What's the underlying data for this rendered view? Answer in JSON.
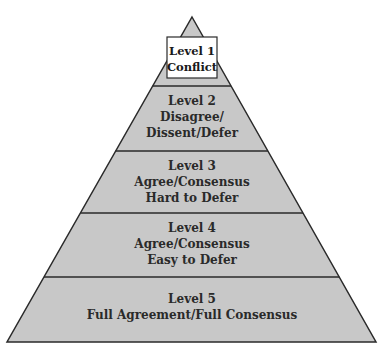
{
  "diagram": {
    "type": "pyramid",
    "colors": {
      "fill": "#c8c8c8",
      "stroke": "#2a2a2a",
      "top_box_fill": "#ffffff"
    },
    "levels": [
      {
        "lines": [
          "Level 1",
          "Conflict"
        ]
      },
      {
        "lines": [
          "Level 2",
          "Disagree/",
          "Dissent/Defer"
        ]
      },
      {
        "lines": [
          "Level 3",
          "Agree/Consensus",
          "Hard to Defer"
        ]
      },
      {
        "lines": [
          "Level 4",
          "Agree/Consensus",
          "Easy to Defer"
        ]
      },
      {
        "lines": [
          "Level 5",
          "Full Agreement/Full Consensus"
        ]
      }
    ]
  }
}
